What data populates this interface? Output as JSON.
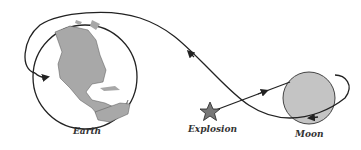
{
  "diagram": {
    "labels": {
      "earth": "Earth",
      "explosion": "Explosion",
      "moon": "Moon"
    },
    "colors": {
      "line": "#222222",
      "land": "#a8a8a8",
      "moon_fill": "#c4c4c4",
      "star_fill": "#777777"
    }
  }
}
